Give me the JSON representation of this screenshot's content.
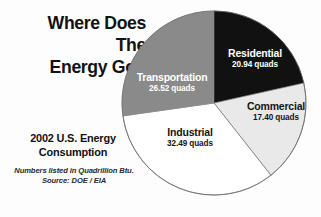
{
  "poster": {
    "title": "Where Does The\nEnergy Go?",
    "subtitle": "2002 U.S. Energy\nConsumption",
    "source_note": "Numbers listed in Quadrillion Btu.",
    "source_credit": "Source:  DOE / EIA",
    "unit_label": "quads"
  },
  "colors": {
    "background": "#fdfdfd",
    "residential": "#111111",
    "transportation": "#8a8a8a",
    "commercial": "#e9e9e9",
    "industrial": "#ffffff",
    "outline": "#6e6e6e",
    "text_dark": "#121212",
    "text_light": "#ffffff"
  },
  "chart_data": {
    "type": "pie",
    "title": "Where Does The Energy Go?",
    "subtitle": "2002 U.S. Energy Consumption",
    "unit": "quadrillion Btu (quads)",
    "total": 97.35,
    "legend": "none (labels placed on slices)",
    "start_angle_deg": 0,
    "direction": "clockwise",
    "categories": [
      "Residential",
      "Commercial",
      "Industrial",
      "Transportation"
    ],
    "values": [
      20.94,
      17.4,
      32.49,
      26.52
    ],
    "slices": [
      {
        "label": "Residential",
        "value": 20.94,
        "value_text": "20.94 quads",
        "percent": 21.5,
        "color": "#111111",
        "label_color": "#ffffff"
      },
      {
        "label": "Commercial",
        "value": 17.4,
        "value_text": "17.40 quads",
        "percent": 17.9,
        "color": "#e9e9e9",
        "label_color": "#151515"
      },
      {
        "label": "Industrial",
        "value": 32.49,
        "value_text": "32.49 quads",
        "percent": 33.4,
        "color": "#ffffff",
        "label_color": "#151515"
      },
      {
        "label": "Transportation",
        "value": 26.52,
        "value_text": "26.52 quads",
        "percent": 27.2,
        "color": "#8a8a8a",
        "label_color": "#ffffff"
      }
    ]
  }
}
